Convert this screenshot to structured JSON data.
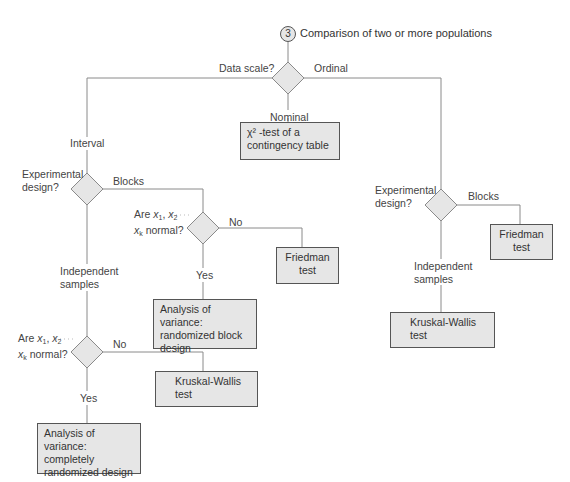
{
  "header": {
    "step_number": "3",
    "title": "Comparison of two or more populations"
  },
  "root": {
    "question": "Data scale?",
    "branches": {
      "left": "Interval",
      "middle": "Nominal",
      "right": "Ordinal"
    }
  },
  "nominal": {
    "result": "χ² -test of a contingency table",
    "result_line1": "χ² -test of a",
    "result_line2": "contingency table"
  },
  "interval": {
    "question": "Experimental design?",
    "question_line1": "Experimental",
    "question_line2": "design?",
    "blocks": {
      "label": "Blocks",
      "question_line1": "Are x1, x2 . . . .",
      "question_line2": "xk normal?",
      "no_label": "No",
      "no_result_line1": "Friedman",
      "no_result_line2": "test",
      "yes_label": "Yes",
      "yes_result_line1": "Analysis of variance:",
      "yes_result_line2": "randomized block",
      "yes_result_line3": "design"
    },
    "independent": {
      "label_line1": "Independent",
      "label_line2": "samples",
      "question_line1": "Are x1, x2 . . . .",
      "question_line2": "xk normal?",
      "no_label": "No",
      "no_result_line1": "Kruskal-Wallis",
      "no_result_line2": "test",
      "yes_label": "Yes",
      "yes_result_line1": "Analysis of variance:",
      "yes_result_line2": "completely",
      "yes_result_line3": "randomized design"
    }
  },
  "ordinal": {
    "question_line1": "Experimental",
    "question_line2": "design?",
    "blocks_label": "Blocks",
    "blocks_result_line1": "Friedman",
    "blocks_result_line2": "test",
    "independent_label_line1": "Independent",
    "independent_label_line2": "samples",
    "independent_result_line1": "Kruskal-Wallis",
    "independent_result_line2": "test"
  },
  "colors": {
    "box_fill": "#e6e6e6",
    "line": "#888888",
    "border": "#555555"
  }
}
